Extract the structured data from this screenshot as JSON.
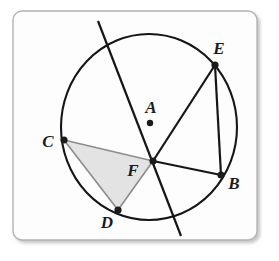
{
  "figure": {
    "kind": "circle-geometry-diagram",
    "caption": "",
    "frame": {
      "x": 13,
      "y": 11,
      "width": 244,
      "height": 229,
      "corner_radius": 9,
      "border_color": "#b3b3b3",
      "fill_color": "#fdfdfd",
      "shadow_color": "#cfcfcf"
    },
    "circle": {
      "name": "circle-A",
      "center": {
        "x": 149,
        "y": 127
      },
      "radius_x": 88,
      "radius_y": 93,
      "stroke_color": "#161616",
      "stroke_width": 2.1,
      "fill": "none"
    },
    "points": [
      {
        "id": "A",
        "label": "A",
        "x": 150,
        "y": 123,
        "label_x": 151,
        "label_y": 113,
        "kind": "center",
        "dot_radius": 3.2
      },
      {
        "id": "B",
        "label": "B",
        "x": 221,
        "y": 175,
        "label_x": 234,
        "label_y": 189,
        "kind": "on-circle",
        "dot_radius": 3.6
      },
      {
        "id": "C",
        "label": "C",
        "x": 64,
        "y": 140,
        "label_x": 48,
        "label_y": 147,
        "kind": "on-circle",
        "dot_radius": 3.6
      },
      {
        "id": "D",
        "label": "D",
        "x": 118,
        "y": 210,
        "label_x": 107,
        "label_y": 228,
        "kind": "on-circle",
        "dot_radius": 3.6
      },
      {
        "id": "E",
        "label": "E",
        "x": 215,
        "y": 65,
        "label_x": 219,
        "label_y": 54,
        "kind": "on-circle",
        "dot_radius": 3.6
      },
      {
        "id": "F",
        "label": "F",
        "x": 153,
        "y": 161,
        "label_x": 133,
        "label_y": 176,
        "kind": "intersection",
        "dot_radius": 3.6
      }
    ],
    "segments": [
      {
        "id": "EF",
        "from": "E",
        "to": "F",
        "stroke_color": "#161616",
        "stroke_width": 2.2
      },
      {
        "id": "EB",
        "from": "E",
        "to": "B",
        "stroke_color": "#161616",
        "stroke_width": 2.2
      },
      {
        "id": "FB",
        "from": "F",
        "to": "B",
        "stroke_color": "#161616",
        "stroke_width": 2.2
      },
      {
        "id": "CF",
        "from": "C",
        "to": "F",
        "stroke_color": "#8c8c8c",
        "stroke_width": 1.6
      },
      {
        "id": "FD",
        "from": "F",
        "to": "D",
        "stroke_color": "#8c8c8c",
        "stroke_width": 1.6
      },
      {
        "id": "CD",
        "from": "C",
        "to": "D",
        "stroke_color": "#8c8c8c",
        "stroke_width": 1.6
      }
    ],
    "secant_line": {
      "id": "secant-through-F",
      "x1": 98,
      "y1": 21,
      "x2": 181,
      "y2": 236,
      "stroke_color": "#161616",
      "stroke_width": 2.2,
      "passes_through": "F"
    },
    "shaded_region": {
      "id": "triangle-CFD",
      "vertices": [
        "C",
        "F",
        "D"
      ],
      "fill_color": "#e3e3e3",
      "stroke_color": "#8c8c8c"
    }
  }
}
